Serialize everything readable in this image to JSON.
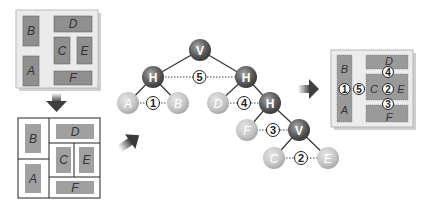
{
  "colors": {
    "block_fill": "#8f8f8f",
    "panel_fill": "#ececec",
    "internal_node": "#5a5a5a",
    "leaf_node": "#c8c8c8",
    "arrow": "#444444"
  },
  "layout_original": {
    "blocks": [
      "B",
      "A",
      "D",
      "C",
      "E",
      "F"
    ]
  },
  "layout_partitioned": {
    "blocks": [
      "B",
      "A",
      "D",
      "C",
      "E",
      "F"
    ]
  },
  "tree": {
    "nodes": [
      {
        "id": "v1",
        "label": "V",
        "type": "internal"
      },
      {
        "id": "h1",
        "label": "H",
        "type": "internal"
      },
      {
        "id": "h2",
        "label": "H",
        "type": "internal"
      },
      {
        "id": "a",
        "label": "A",
        "type": "leaf"
      },
      {
        "id": "b",
        "label": "B",
        "type": "leaf"
      },
      {
        "id": "d",
        "label": "D",
        "type": "leaf"
      },
      {
        "id": "h3",
        "label": "H",
        "type": "internal"
      },
      {
        "id": "f",
        "label": "F",
        "type": "leaf"
      },
      {
        "id": "v2",
        "label": "V",
        "type": "internal"
      },
      {
        "id": "c",
        "label": "C",
        "type": "leaf"
      },
      {
        "id": "e",
        "label": "E",
        "type": "leaf"
      }
    ],
    "edges": [
      [
        "v1",
        "h1"
      ],
      [
        "v1",
        "h2"
      ],
      [
        "h1",
        "a"
      ],
      [
        "h1",
        "b"
      ],
      [
        "h2",
        "d"
      ],
      [
        "h2",
        "h3"
      ],
      [
        "h3",
        "f"
      ],
      [
        "h3",
        "v2"
      ],
      [
        "v2",
        "c"
      ],
      [
        "v2",
        "e"
      ]
    ],
    "channels": [
      {
        "label": "5",
        "from": "h1",
        "to": "h2"
      },
      {
        "label": "1",
        "from": "a",
        "to": "b"
      },
      {
        "label": "4",
        "from": "d",
        "to": "h3"
      },
      {
        "label": "3",
        "from": "f",
        "to": "v2"
      },
      {
        "label": "2",
        "from": "c",
        "to": "e"
      }
    ]
  },
  "channel_layout": {
    "blocks": [
      "B",
      "A",
      "D",
      "C",
      "E",
      "F"
    ],
    "channels": [
      "1",
      "5",
      "4",
      "2",
      "3"
    ]
  }
}
